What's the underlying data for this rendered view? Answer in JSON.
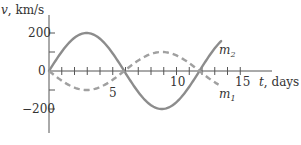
{
  "chart_data": {
    "type": "line",
    "title": "",
    "xlabel": "t, days",
    "ylabel": "v, km/s",
    "xlim": [
      0,
      17
    ],
    "ylim": [
      -300,
      300
    ],
    "x_ticks": [
      5,
      10,
      15
    ],
    "y_ticks": [
      200,
      0,
      -200
    ],
    "minor_x_tick_step": 1,
    "minor_y_tick_step": 100,
    "grid": false,
    "series": [
      {
        "name": "m2",
        "style": "solid",
        "color": "#8c8c8c",
        "amplitude": 200,
        "period_days": 11.8,
        "t_end": 13.5,
        "x": [
          0,
          1.5,
          2.95,
          4.4,
          5.9,
          7.4,
          8.85,
          10.3,
          11.8,
          13.5
        ],
        "values": [
          0,
          141,
          200,
          141,
          0,
          -141,
          -200,
          -141,
          0,
          88
        ]
      },
      {
        "name": "m1",
        "style": "dashed",
        "color": "#a0a0a0",
        "amplitude": 100,
        "period_days": 11.8,
        "t_end": 13.3,
        "x": [
          0,
          1.5,
          2.95,
          4.4,
          5.9,
          7.4,
          8.85,
          10.3,
          11.8,
          13.3
        ],
        "values": [
          0,
          -71,
          -100,
          -71,
          0,
          71,
          100,
          71,
          0,
          -70
        ]
      }
    ],
    "annotations": [
      "m2",
      "m1"
    ]
  },
  "labels": {
    "y_axis": "v, km/s",
    "y_axis_var": "v",
    "y_axis_unit": ", km/s",
    "x_axis_var": "t",
    "x_axis_unit": ", days",
    "y200": "200",
    "y0": "0",
    "yneg200": "−200",
    "x5": "5",
    "x10": "10",
    "x15": "15",
    "m2_base": "m",
    "m2_sub": "2",
    "m1_base": "m",
    "m1_sub": "1"
  }
}
